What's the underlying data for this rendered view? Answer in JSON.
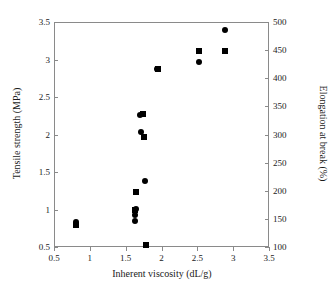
{
  "chart_data": {
    "type": "scatter",
    "title": "",
    "xlabel": "Inherent viscosity (dL/g)",
    "ylabel": "Tensile strength (MPa)",
    "y2label": "Elongation at break (%)",
    "xlim": [
      0.5,
      3.5
    ],
    "ylim": [
      0.5,
      3.5
    ],
    "y2lim": [
      100,
      500
    ],
    "grid": false,
    "legend": "none",
    "xticks": [
      0.5,
      1,
      1.5,
      2,
      2.5,
      3,
      3.5
    ],
    "xticklabels": [
      "0.5",
      "1",
      "1.5",
      "2",
      "2.5",
      "3",
      "3.5"
    ],
    "yticks": [
      0.5,
      1,
      1.5,
      2,
      2.5,
      3,
      3.5
    ],
    "yticklabels": [
      "0.5",
      "1",
      "1.5",
      "2",
      "2.5",
      "3",
      "3.5"
    ],
    "y2ticks": [
      100,
      150,
      200,
      250,
      300,
      350,
      400,
      450,
      500
    ],
    "y2ticklabels": [
      "100",
      "150",
      "200",
      "250",
      "300",
      "350",
      "400",
      "450",
      "500"
    ],
    "marker_color": "#000000",
    "axis_color": "#8a8a8a",
    "series": [
      {
        "name": "Tensile strength (MPa)",
        "marker": "circle",
        "axis": "left",
        "points": [
          {
            "x": 0.8,
            "y": 0.79
          },
          {
            "x": 0.81,
            "y": 0.84
          },
          {
            "x": 1.63,
            "y": 0.85
          },
          {
            "x": 1.63,
            "y": 0.93
          },
          {
            "x": 1.64,
            "y": 1.01
          },
          {
            "x": 1.71,
            "y": 2.04
          },
          {
            "x": 1.7,
            "y": 2.26
          },
          {
            "x": 1.77,
            "y": 1.38
          },
          {
            "x": 1.94,
            "y": 2.88
          },
          {
            "x": 2.53,
            "y": 2.97
          },
          {
            "x": 2.52,
            "y": 3.11
          },
          {
            "x": 2.88,
            "y": 3.39
          }
        ]
      },
      {
        "name": "Elongation at break (%)",
        "marker": "square",
        "axis": "right",
        "points": [
          {
            "x": 0.8,
            "y": 0.8
          },
          {
            "x": 1.63,
            "y": 1.0
          },
          {
            "x": 1.64,
            "y": 1.23
          },
          {
            "x": 1.75,
            "y": 1.97
          },
          {
            "x": 1.74,
            "y": 2.28
          },
          {
            "x": 1.78,
            "y": 0.53
          },
          {
            "x": 1.95,
            "y": 2.87
          },
          {
            "x": 2.53,
            "y": 3.12
          },
          {
            "x": 2.89,
            "y": 3.12
          }
        ]
      }
    ]
  }
}
